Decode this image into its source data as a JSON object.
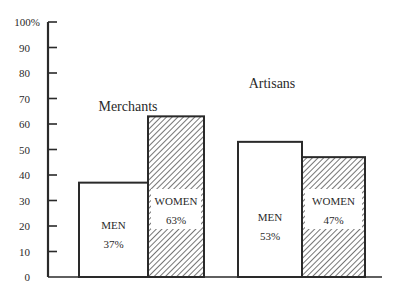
{
  "chart_data": {
    "type": "bar",
    "title": "",
    "xlabel": "",
    "ylabel": "",
    "ylim": [
      0,
      100
    ],
    "y_ticks": [
      "0",
      "10",
      "20",
      "30",
      "40",
      "50",
      "60",
      "70",
      "80",
      "90",
      "100%"
    ],
    "categories": [
      "Merchants",
      "Artisans"
    ],
    "series": [
      {
        "name": "MEN",
        "values": [
          37,
          53
        ],
        "labels": [
          "37%",
          "53%"
        ],
        "fill": "plain"
      },
      {
        "name": "WOMEN",
        "values": [
          63,
          47
        ],
        "labels": [
          "63%",
          "47%"
        ],
        "fill": "hatched"
      }
    ],
    "grid": false,
    "legend": "inline labels on bars"
  },
  "colors": {
    "ink": "#2a2a2a",
    "background": "#ffffff"
  }
}
